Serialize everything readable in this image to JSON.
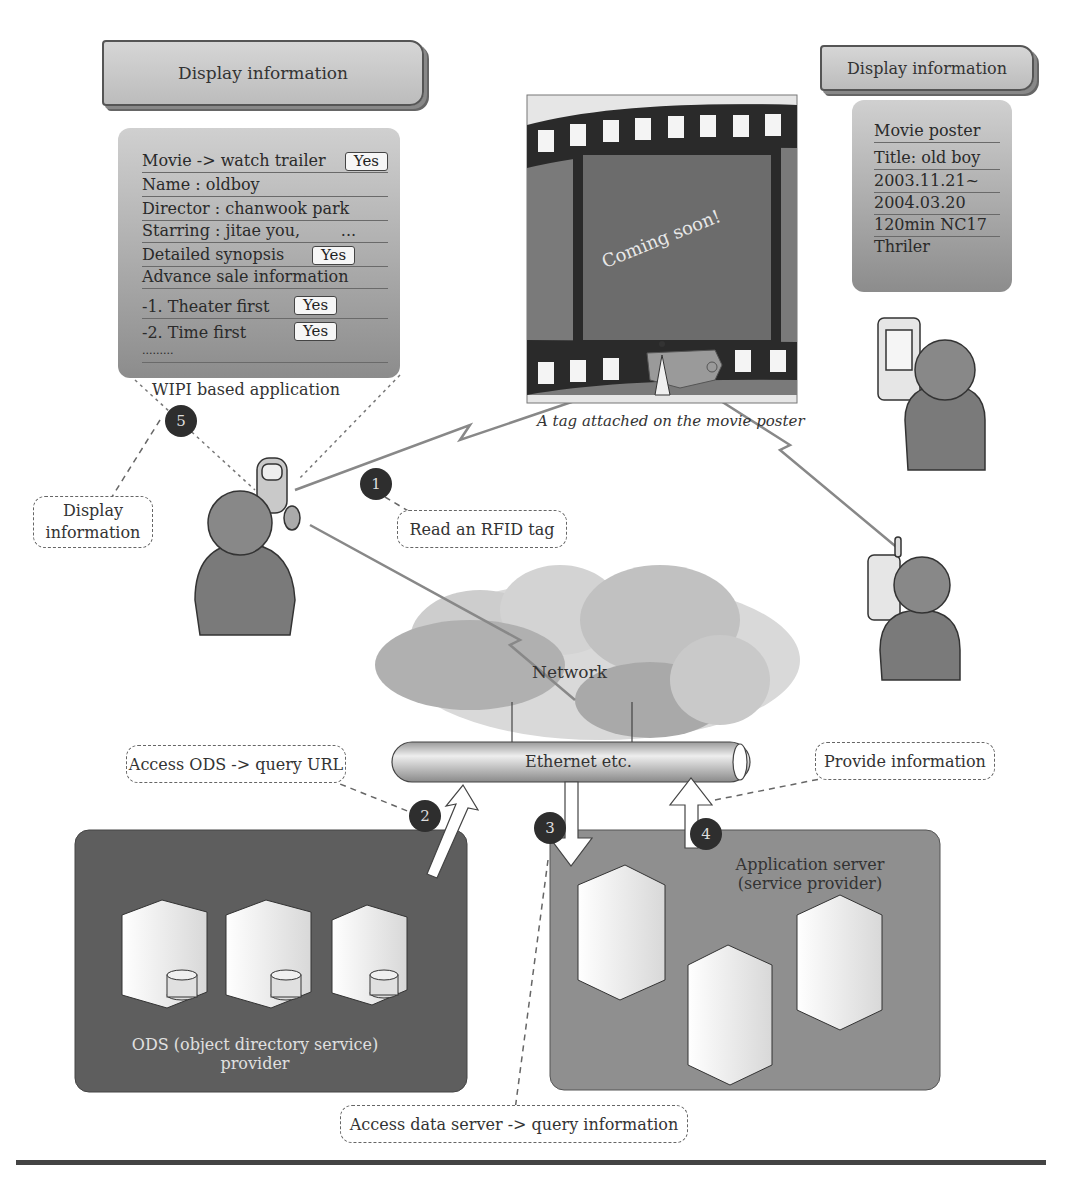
{
  "left_notebook": {
    "title": "Display information"
  },
  "wipi_panel": {
    "rows": [
      {
        "label": "Movie -> watch trailer",
        "button": "Yes"
      },
      {
        "label": "Name : oldboy"
      },
      {
        "label": "Director : chanwook park"
      },
      {
        "label": "Starring : jitae you,        ..."
      },
      {
        "label": "Detailed synopsis",
        "button": "Yes"
      },
      {
        "label": "Advance sale information"
      },
      {
        "label": "-1. Theater first",
        "button": "Yes"
      },
      {
        "label": "-2. Time first",
        "button": "Yes"
      },
      {
        "label": "........."
      }
    ],
    "caption": "WIPI based application"
  },
  "right_notebook": {
    "title": "Display information"
  },
  "poster_panel": {
    "rows": [
      "Movie poster",
      "Title: old boy",
      "2003.11.21~",
      "2004.03.20",
      "120min NC17",
      "Thriler"
    ]
  },
  "movie_poster": {
    "text": "Coming soon!",
    "caption": "A tag attached on the movie poster"
  },
  "steps": [
    {
      "number": "1",
      "label": "Read an RFID tag"
    },
    {
      "number": "2",
      "label": "Access ODS -> query URL"
    },
    {
      "number": "3",
      "label": "Access data server -> query information"
    },
    {
      "number": "4",
      "label": "Provide information"
    },
    {
      "number": "5",
      "label": "Display\ninformation"
    }
  ],
  "network": {
    "cloud_label": "Network",
    "pipe_label": "Ethernet etc."
  },
  "ods_zone": {
    "label_line1": "ODS (object directory service)",
    "label_line2": "provider"
  },
  "app_zone": {
    "label_line1": "Application server",
    "label_line2": "(service provider)"
  },
  "colors": {
    "ods_zone": "#5e5e5e",
    "app_zone": "#8f8f8f",
    "badge": "#2e2e2e",
    "film": "#2a2a2a",
    "poster_screen": "#6c6c6c"
  }
}
